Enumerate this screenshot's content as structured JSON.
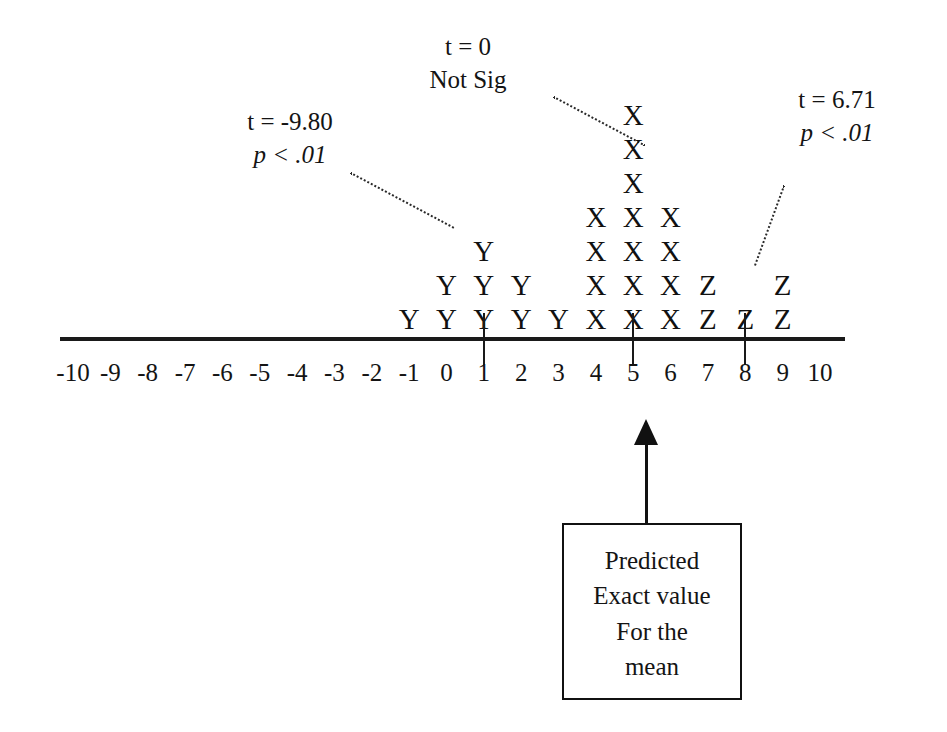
{
  "figure": {
    "background_color": "#ffffff",
    "ink_color": "#111111"
  },
  "axis": {
    "min": -10,
    "max": 10,
    "labels": [
      "-10",
      "-9",
      "-8",
      "-7",
      "-6",
      "-5",
      "-4",
      "-3",
      "-2",
      "-1",
      "0",
      "1",
      "2",
      "3",
      "4",
      "5",
      "6",
      "7",
      "8",
      "9",
      "10"
    ],
    "tick_values": [
      1,
      5,
      8
    ],
    "line_color": "#1a1a1a"
  },
  "annotations": [
    {
      "name": "left-annotation",
      "line1": "t = -9.80",
      "line2": "p < .01",
      "line2_italic_lead": "p",
      "target": "Y group"
    },
    {
      "name": "center-annotation",
      "line1": "t = 0",
      "line2": "Not Sig",
      "line2_italic_lead": "",
      "target": "X group"
    },
    {
      "name": "right-annotation",
      "line1": "t = 6.71",
      "line2": "p < .01",
      "line2_italic_lead": "p",
      "target": "Z group"
    }
  ],
  "callout_box": {
    "lines": [
      "Predicted",
      "Exact value",
      "For the",
      "mean"
    ],
    "points_to": 5
  },
  "chart_data": {
    "type": "scatter",
    "title": "",
    "subtitle": "",
    "xlabel": "",
    "ylabel": "",
    "xlim": [
      -10,
      10
    ],
    "grid": false,
    "legend": "none",
    "tick_values": [
      1,
      5,
      8
    ],
    "series": [
      {
        "name": "Y",
        "glyph": "Y",
        "t": "-9.80",
        "p": "p < .01",
        "points": [
          {
            "x": -1,
            "count": 1
          },
          {
            "x": 0,
            "count": 2
          },
          {
            "x": 1,
            "count": 3
          },
          {
            "x": 2,
            "count": 2
          },
          {
            "x": 3,
            "count": 1
          }
        ],
        "values": [
          -1,
          0,
          0,
          1,
          1,
          1,
          2,
          2,
          3
        ],
        "n": 9
      },
      {
        "name": "X",
        "glyph": "X",
        "t": "0",
        "p": "Not Sig",
        "points": [
          {
            "x": 4,
            "count": 4
          },
          {
            "x": 5,
            "count": 7
          },
          {
            "x": 6,
            "count": 4
          }
        ],
        "values": [
          4,
          4,
          4,
          4,
          5,
          5,
          5,
          5,
          5,
          5,
          5,
          6,
          6,
          6,
          6
        ],
        "n": 15
      },
      {
        "name": "Z",
        "glyph": "Z",
        "t": "6.71",
        "p": "p < .01",
        "points": [
          {
            "x": 7,
            "count": 2
          },
          {
            "x": 8,
            "count": 1
          },
          {
            "x": 9,
            "count": 2
          }
        ],
        "values": [
          7,
          7,
          8,
          9,
          9
        ],
        "n": 5
      }
    ]
  }
}
